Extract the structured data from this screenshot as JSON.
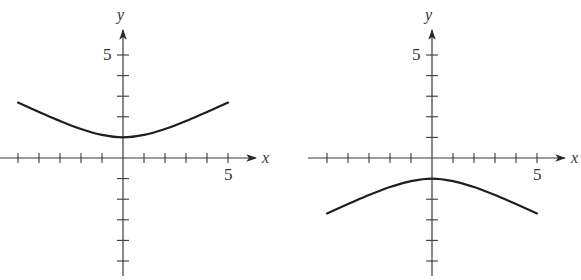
{
  "chart_data": [
    {
      "type": "line",
      "title": "",
      "xlabel": "x",
      "ylabel": "y",
      "xlim": [
        -5,
        5
      ],
      "ylim": [
        -5,
        5
      ],
      "x_tick_label": "5",
      "y_tick_label": "5",
      "grid": false,
      "description": "Upward-opening hyperbola branch, minimum at (0,1)",
      "series": [
        {
          "name": "curve",
          "x": [
            -5,
            -4,
            -3,
            -2,
            -1,
            0,
            1,
            2,
            3,
            4,
            5
          ],
          "values": [
            2.69,
            2.24,
            1.8,
            1.41,
            1.12,
            1.0,
            1.12,
            1.41,
            1.8,
            2.24,
            2.69
          ]
        }
      ]
    },
    {
      "type": "line",
      "title": "",
      "xlabel": "x",
      "ylabel": "y",
      "xlim": [
        -5,
        5
      ],
      "ylim": [
        -5,
        5
      ],
      "x_tick_label": "5",
      "y_tick_label": "5",
      "grid": false,
      "description": "Downward-opening hyperbola branch, maximum at (0,-1)",
      "series": [
        {
          "name": "curve",
          "x": [
            -5,
            -4,
            -3,
            -2,
            -1,
            0,
            1,
            2,
            3,
            4,
            5
          ],
          "values": [
            -2.69,
            -2.24,
            -1.8,
            -1.41,
            -1.12,
            -1.0,
            -1.12,
            -1.41,
            -1.8,
            -2.24,
            -2.69
          ]
        }
      ]
    }
  ],
  "graphs": [
    {
      "x_label": "x",
      "y_label": "y",
      "x_tick": "5",
      "y_tick": "5"
    },
    {
      "x_label": "x",
      "y_label": "y",
      "x_tick": "5",
      "y_tick": "5"
    }
  ]
}
